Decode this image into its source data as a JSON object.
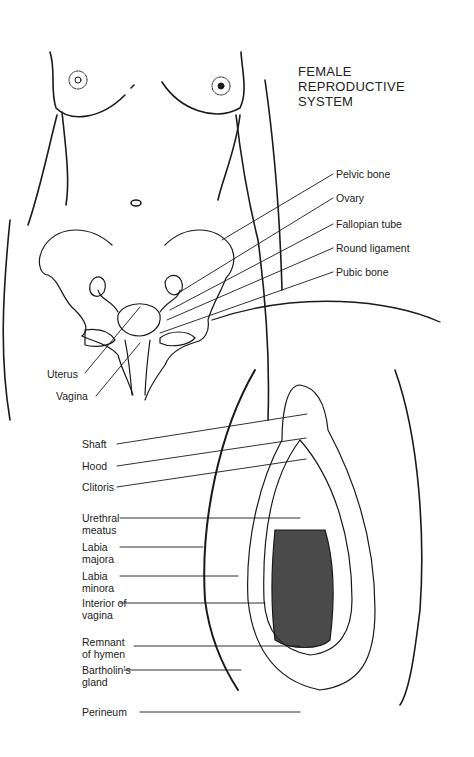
{
  "title": "FEMALE\nREPRODUCTIVE\nSYSTEM",
  "upper_labels": {
    "pelvic_bone": "Pelvic bone",
    "ovary": "Ovary",
    "fallopian_tube": "Fallopian tube",
    "round_ligament": "Round ligament",
    "pubic_bone": "Pubic bone",
    "uterus": "Uterus",
    "vagina": "Vagina"
  },
  "lower_labels": {
    "shaft": "Shaft",
    "hood": "Hood",
    "clitoris": "Clitoris",
    "urethral_meatus": "Urethral\nmeatus",
    "labia_majora": "Labia\nmajora",
    "labia_minora": "Labia\nminora",
    "interior_of_vagina": "Interior of\nvagina",
    "remnant_of_hymen": "Remnant\nof hymen",
    "bartholins_gland": "Bartholin's\ngland",
    "perineum": "Perineum"
  },
  "colors": {
    "ink": "#1a1a1a",
    "background": "#ffffff"
  }
}
